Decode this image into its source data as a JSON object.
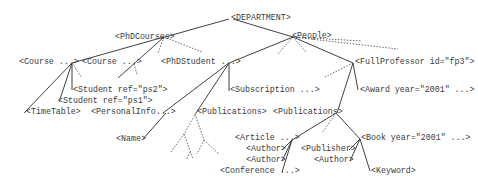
{
  "diagram": {
    "type": "xml-tree",
    "nodes": [
      {
        "id": "department",
        "label": "<DEPARTMENT>",
        "x": 231,
        "y": 20
      },
      {
        "id": "phdcourses",
        "label": "<PhDCourses>",
        "x": 115,
        "y": 39
      },
      {
        "id": "people",
        "label": "<People>",
        "x": 292,
        "y": 38
      },
      {
        "id": "course1",
        "label": "<Course ...>",
        "x": 19,
        "y": 64
      },
      {
        "id": "course2",
        "label": "<Course ...>",
        "x": 82,
        "y": 64
      },
      {
        "id": "phdstudent",
        "label": "<PhDStudent ...>",
        "x": 161,
        "y": 64
      },
      {
        "id": "fullprofessor",
        "label": "<FullProfessor id=\"fp3\">",
        "x": 355,
        "y": 64
      },
      {
        "id": "student_ps2",
        "label": "<Student ref=\"ps2\">",
        "x": 73,
        "y": 92
      },
      {
        "id": "student_ps1",
        "label": "<Student ref=\"ps1\">",
        "x": 58,
        "y": 103
      },
      {
        "id": "subscription",
        "label": "<Subscription ...>",
        "x": 230,
        "y": 92
      },
      {
        "id": "award",
        "label": "<Award year=\"2001\" ...>",
        "x": 360,
        "y": 92
      },
      {
        "id": "timetable",
        "label": "<TimeTable>",
        "x": 29,
        "y": 114
      },
      {
        "id": "personalinfo",
        "label": "<PersonalInfo...>",
        "x": 91,
        "y": 114
      },
      {
        "id": "publications1",
        "label": "<Publications>",
        "x": 199,
        "y": 114
      },
      {
        "id": "publications2",
        "label": "<Publications>",
        "x": 273,
        "y": 114
      },
      {
        "id": "name",
        "label": "<Name>",
        "x": 116,
        "y": 141
      },
      {
        "id": "article",
        "label": "<Article ...>",
        "x": 235,
        "y": 140
      },
      {
        "id": "book",
        "label": "<Book year=\"2001\" ...>",
        "x": 362,
        "y": 140
      },
      {
        "id": "author1",
        "label": "<Author>",
        "x": 246,
        "y": 150
      },
      {
        "id": "publisher",
        "label": "<Publisher>",
        "x": 301,
        "y": 150
      },
      {
        "id": "author2",
        "label": "<Author>",
        "x": 246,
        "y": 161
      },
      {
        "id": "author3",
        "label": "<Author>",
        "x": 314,
        "y": 161
      },
      {
        "id": "conference",
        "label": "<Conference ...>",
        "x": 213,
        "y": 172
      },
      {
        "id": "keyword",
        "label": "<Keyword>",
        "x": 370,
        "y": 172
      }
    ],
    "edges": [
      {
        "from": "department",
        "to": "phdcourses"
      },
      {
        "from": "department",
        "to": "people"
      },
      {
        "from": "phdcourses",
        "to": "course1"
      },
      {
        "from": "people",
        "to": "phdstudent"
      },
      {
        "from": "people",
        "to": "fullprofessor"
      },
      {
        "from": "course1",
        "to": "timetable"
      },
      {
        "from": "course1",
        "to": "student_ps1"
      },
      {
        "from": "course1",
        "to": "student_ps2"
      },
      {
        "from": "phdstudent",
        "to": "personalinfo"
      },
      {
        "from": "phdstudent",
        "to": "publications1"
      },
      {
        "from": "phdstudent",
        "to": "subscription"
      },
      {
        "from": "personalinfo",
        "to": "name"
      },
      {
        "from": "fullprofessor",
        "to": "award"
      },
      {
        "from": "fullprofessor",
        "to": "publications2"
      },
      {
        "from": "publications2",
        "to": "article"
      },
      {
        "from": "publications2",
        "to": "book"
      },
      {
        "from": "article",
        "to": "author1"
      },
      {
        "from": "article",
        "to": "author2"
      },
      {
        "from": "article",
        "to": "conference"
      },
      {
        "from": "book",
        "to": "publisher"
      },
      {
        "from": "book",
        "to": "author3"
      },
      {
        "from": "book",
        "to": "keyword"
      }
    ],
    "dotted_edges_note": "elided subtrees drawn as dotted lines"
  }
}
